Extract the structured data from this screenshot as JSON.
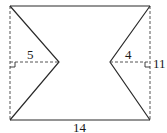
{
  "diagram": {
    "type": "geometry-figure",
    "colors": {
      "line": "#2a2a2a",
      "dashed": "#555555",
      "background": "#ffffff"
    },
    "labels": {
      "left_notch_depth": "5",
      "right_notch_depth": "4",
      "height": "11",
      "width": "14"
    },
    "dimensions": {
      "width": 14,
      "height": 11,
      "left_notch_depth": 5,
      "right_notch_depth": 4
    }
  }
}
